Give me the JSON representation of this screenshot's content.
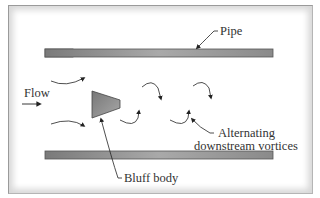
{
  "diagram": {
    "type": "vortex flowmeter schematic",
    "labels": {
      "pipe": "Pipe",
      "flow": "Flow",
      "bluff_body": "Bluff body",
      "vortices_line1": "Alternating",
      "vortices_line2": "downstream vortices"
    },
    "colors": {
      "pipe_fill": "#8a8a8a",
      "pipe_stroke": "#555555",
      "bluff_body_fill": "#8c8c8c",
      "line": "#222222",
      "frame_border": "#9a9a9a",
      "text": "#333333"
    }
  }
}
